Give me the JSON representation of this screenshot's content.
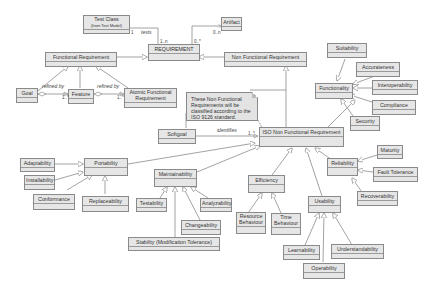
{
  "classes": {
    "test_class": {
      "line1": "Test Class",
      "line2": "(from Test Model)"
    },
    "artifact": "Artifact",
    "requirement": "REQUIREMENT",
    "functional_requirement": "Functional Requirement",
    "non_functional_requirement": "Non Functional Requirement",
    "goal": "Goal",
    "feature": "Feature",
    "atomic_functional_requirement": {
      "line1": "Atomic Functional",
      "line2": "Requirement"
    },
    "softgoal": "Softgoal",
    "iso_nfr": "ISO Non Functional Requirement",
    "suitability": "Suitability",
    "accurateness": "Accurateness",
    "functionality": "Functionality",
    "interoperability": "Interoperability",
    "compliance": "Compliance",
    "security": "Security",
    "portability": "Portability",
    "adaptability": "Adaptability",
    "installability": "Installability",
    "conformance": "Conformance",
    "replaceability": "Replaceability",
    "maintainability": "Maintainability",
    "testability": "Testability",
    "analyzability": "Analyzability",
    "changeability": "Changeability",
    "stability": "Stability (Modification Tolerance)",
    "efficiency": "Efficiency",
    "resource_behaviour": {
      "line1": "Resource",
      "line2": "Behaviour"
    },
    "time_behaviour": {
      "line1": "Time",
      "line2": "Behaviour"
    },
    "reliability": "Reliability",
    "maturity": "Maturity",
    "fault_tolerance": "Fault Tolerance",
    "recoverability": "Recoverability",
    "usability": "Usability",
    "learnability": "Learnability",
    "understandability": "Understandability",
    "operability": "Operability"
  },
  "note": {
    "line1": "These Non Functional",
    "line2": "Requirements will be",
    "line3": "classified according to the",
    "line4": "ISO 9126 standard."
  },
  "labels": {
    "tests": "tests",
    "refined_by_1": "refined by",
    "refined_by_2": "refined by",
    "identifies": "identifies"
  },
  "multiplicities": {
    "test_class_end": "1",
    "requirement_tests_end": "1..n",
    "requirement_artifact_end": "0..*",
    "artifact_end": "0..n",
    "feature_goal_end": "1..*",
    "atomic_feature_end": "1..*",
    "iso_identifies_end": "1..*"
  },
  "colors": {
    "box_fill": "#e6e6e6",
    "box_border": "#8a8a8a",
    "line": "#8c8c8c",
    "background": "#ffffff"
  }
}
